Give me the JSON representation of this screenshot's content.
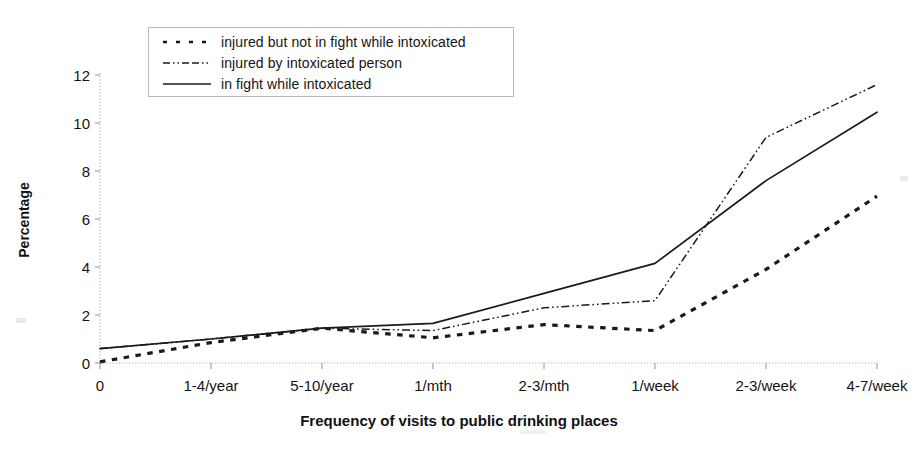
{
  "chart_data": {
    "type": "line",
    "title": "",
    "xlabel": "Frequency of visits to public drinking places",
    "ylabel": "Percentage",
    "categories": [
      "0",
      "1-4/year",
      "5-10/year",
      "1/mth",
      "2-3/mth",
      "1/week",
      "2-3/week",
      "4-7/week"
    ],
    "ylim": [
      0,
      12
    ],
    "yticks": [
      "0",
      "2",
      "4",
      "6",
      "8",
      "10",
      "12"
    ],
    "grid": false,
    "legend_position": "top-left",
    "series": [
      {
        "name": "injured but not in fight while intoxicated",
        "style": "dotted",
        "color": "#1a1a1a",
        "values": [
          0.05,
          0.85,
          1.45,
          1.05,
          1.6,
          1.35,
          3.9,
          6.95
        ]
      },
      {
        "name": "injured by intoxicated person",
        "style": "dash-dot",
        "color": "#1a1a1a",
        "values": [
          0.6,
          1.0,
          1.45,
          1.35,
          2.3,
          2.6,
          9.4,
          11.6
        ]
      },
      {
        "name": "in fight while intoxicated",
        "style": "solid",
        "color": "#1a1a1a",
        "values": [
          0.6,
          1.0,
          1.45,
          1.65,
          2.9,
          4.15,
          7.6,
          10.45
        ]
      }
    ]
  },
  "axis": {
    "y_title": "Percentage",
    "x_title": "Frequency of visits to public drinking places"
  },
  "legend": {
    "items": [
      {
        "label": "injured but not in fight while intoxicated",
        "style": "dotted"
      },
      {
        "label": "injured by intoxicated person",
        "style": "dash-dot"
      },
      {
        "label": "in fight while intoxicated",
        "style": "solid"
      }
    ]
  },
  "colors": {
    "ink": "#1a1a1a",
    "axis": "#9a9a9a",
    "legend_border": "#b9b9b9",
    "background": "#ffffff"
  }
}
